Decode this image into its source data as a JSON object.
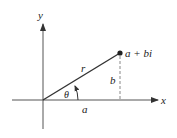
{
  "diagram": {
    "labels": {
      "y_axis": "y",
      "x_axis": "x",
      "point": "a + bi",
      "radius": "r",
      "angle": "θ",
      "vertical_leg": "b",
      "horizontal_leg": "a"
    },
    "colors": {
      "axis": "#555555",
      "vector": "#333333",
      "dashed": "#888888",
      "text": "#222222"
    },
    "geometry": {
      "origin": [
        43,
        100
      ],
      "point": [
        120,
        53
      ]
    }
  }
}
